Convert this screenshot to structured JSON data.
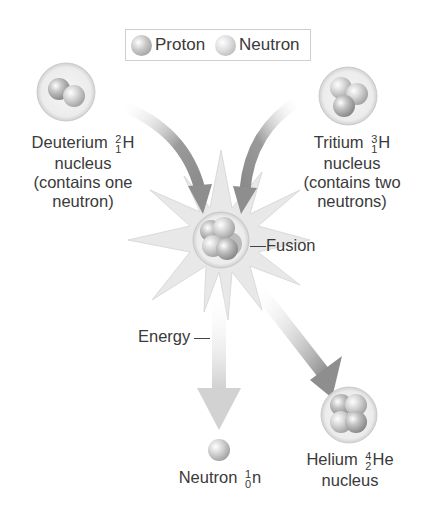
{
  "legend": {
    "items": [
      {
        "name": "proton",
        "label": "Proton"
      },
      {
        "name": "neutron",
        "label": "Neutron"
      }
    ]
  },
  "deuterium": {
    "name": "Deuterium",
    "mass_number": "2",
    "atomic_number": "1",
    "symbol": "H",
    "line2": "nucleus",
    "line3": "(contains one",
    "line4": "neutron)"
  },
  "tritium": {
    "name": "Tritium",
    "mass_number": "3",
    "atomic_number": "1",
    "symbol": "H",
    "line2": "nucleus",
    "line3": "(contains two",
    "line4": "neutrons)"
  },
  "fusion": {
    "label": "Fusion"
  },
  "energy": {
    "label": "Energy"
  },
  "neutron_product": {
    "name": "Neutron",
    "mass_number": "1",
    "atomic_number": "0",
    "symbol": "n"
  },
  "helium": {
    "name": "Helium",
    "mass_number": "4",
    "atomic_number": "2",
    "symbol": "He",
    "line2": "nucleus"
  },
  "colors": {
    "arrow_dark": "#8c8c8c",
    "arrow_light": "#d8d8d8",
    "starburst": "#e6e6e6",
    "text": "#3a3a3a"
  }
}
